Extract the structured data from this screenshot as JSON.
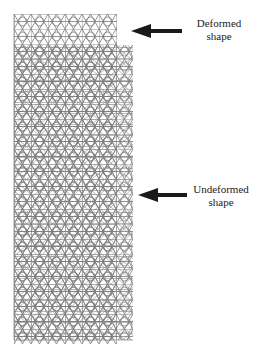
{
  "figure": {
    "labels": {
      "deformed": {
        "line1": "Deformed",
        "line2": "shape"
      },
      "undeformed": {
        "line1": "Undeformed",
        "line2": "shape"
      }
    },
    "colors": {
      "lattice": "#7a7a7a",
      "arrow": "#1a1a1a",
      "text": "#222222"
    }
  }
}
